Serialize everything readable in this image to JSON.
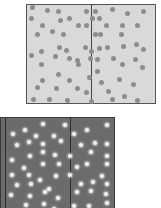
{
  "colors": {
    "top_fill": "#d9d9d9",
    "top_dot": "#8d8d8d",
    "bottom_fill": "#6b6b6b",
    "bottom_dot": "#f0f0f0"
  },
  "top_dots": [
    [
      3,
      0
    ],
    [
      18,
      3
    ],
    [
      29,
      4
    ],
    [
      57,
      4
    ],
    [
      66,
      4
    ],
    [
      83,
      2
    ],
    [
      98,
      6
    ],
    [
      114,
      4
    ],
    [
      2,
      11
    ],
    [
      63,
      11
    ],
    [
      40,
      11
    ],
    [
      70,
      11
    ],
    [
      31,
      13
    ],
    [
      13,
      18
    ],
    [
      49,
      18
    ],
    [
      57,
      18
    ],
    [
      77,
      18
    ],
    [
      93,
      18
    ],
    [
      108,
      18
    ],
    [
      8,
      27
    ],
    [
      34,
      27
    ],
    [
      23,
      24
    ],
    [
      66,
      27
    ],
    [
      71,
      27
    ],
    [
      92,
      27
    ],
    [
      30,
      40
    ],
    [
      56,
      40
    ],
    [
      70,
      41
    ],
    [
      107,
      37
    ],
    [
      12,
      44
    ],
    [
      37,
      43
    ],
    [
      62,
      44
    ],
    [
      78,
      40
    ],
    [
      94,
      39
    ],
    [
      114,
      42
    ],
    [
      2,
      48
    ],
    [
      26,
      49
    ],
    [
      40,
      51
    ],
    [
      61,
      51
    ],
    [
      48,
      53
    ],
    [
      68,
      52
    ],
    [
      84,
      51
    ],
    [
      106,
      52
    ],
    [
      12,
      57
    ],
    [
      49,
      57
    ],
    [
      93,
      57
    ],
    [
      113,
      60
    ],
    [
      29,
      67
    ],
    [
      60,
      70
    ],
    [
      68,
      64
    ],
    [
      90,
      72
    ],
    [
      13,
      73
    ],
    [
      40,
      73
    ],
    [
      72,
      75
    ],
    [
      104,
      77
    ],
    [
      8,
      80
    ],
    [
      27,
      81
    ],
    [
      48,
      81
    ],
    [
      57,
      85
    ],
    [
      79,
      84
    ],
    [
      95,
      89
    ],
    [
      4,
      92
    ],
    [
      20,
      92
    ],
    [
      38,
      93
    ],
    [
      62,
      94
    ],
    [
      83,
      92
    ],
    [
      108,
      93
    ]
  ],
  "bottom_dots": [
    [
      22,
      10
    ],
    [
      40,
      4
    ],
    [
      62,
      5
    ],
    [
      10,
      14
    ],
    [
      33,
      16
    ],
    [
      51,
      16
    ],
    [
      71,
      14
    ],
    [
      84,
      10
    ],
    [
      104,
      5
    ],
    [
      14,
      25
    ],
    [
      26,
      22
    ],
    [
      40,
      24
    ],
    [
      58,
      21
    ],
    [
      78,
      25
    ],
    [
      92,
      23
    ],
    [
      104,
      24
    ],
    [
      9,
      40
    ],
    [
      27,
      36
    ],
    [
      40,
      32
    ],
    [
      52,
      35
    ],
    [
      67,
      36
    ],
    [
      88,
      32
    ],
    [
      104,
      36
    ],
    [
      21,
      48
    ],
    [
      40,
      44
    ],
    [
      56,
      44
    ],
    [
      74,
      47
    ],
    [
      84,
      44
    ],
    [
      104,
      44
    ],
    [
      9,
      55
    ],
    [
      26,
      55
    ],
    [
      37,
      60
    ],
    [
      53,
      56
    ],
    [
      67,
      55
    ],
    [
      99,
      56
    ],
    [
      14,
      65
    ],
    [
      28,
      64
    ],
    [
      46,
      69
    ],
    [
      78,
      64
    ],
    [
      90,
      62
    ],
    [
      104,
      64
    ],
    [
      8,
      75
    ],
    [
      27,
      76
    ],
    [
      42,
      72
    ],
    [
      55,
      78
    ],
    [
      74,
      72
    ],
    [
      88,
      71
    ],
    [
      103,
      74
    ],
    [
      23,
      85
    ],
    [
      41,
      84
    ],
    [
      51,
      89
    ],
    [
      71,
      86
    ],
    [
      86,
      86
    ],
    [
      104,
      83
    ]
  ]
}
